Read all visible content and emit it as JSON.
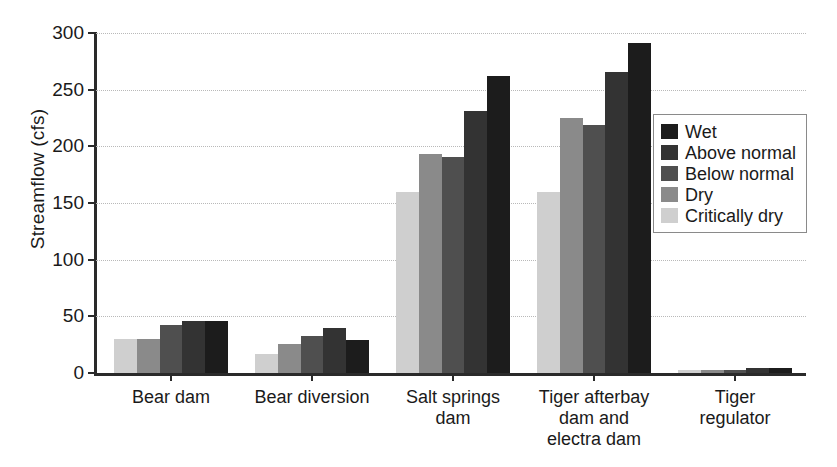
{
  "chart_data": {
    "type": "bar",
    "title": "",
    "xlabel": "",
    "ylabel": "Streamflow (cfs)",
    "ylim": [
      0,
      300
    ],
    "yticks": [
      0,
      50,
      100,
      150,
      200,
      250,
      300
    ],
    "grid": true,
    "legend_position": "right",
    "categories": [
      "Bear dam",
      "Bear diversion",
      "Salt springs dam",
      "Tiger afterbay dam and electra dam",
      "Tiger regulator"
    ],
    "category_lines": [
      [
        "Bear dam"
      ],
      [
        "Bear diversion"
      ],
      [
        "Salt springs",
        "dam"
      ],
      [
        "Tiger afterbay",
        "dam and",
        "electra dam"
      ],
      [
        "Tiger regulator"
      ]
    ],
    "series_draw_order": [
      "Critically dry",
      "Dry",
      "Below normal",
      "Above normal",
      "Wet"
    ],
    "series": [
      {
        "name": "Wet",
        "color": "#1c1c1c",
        "values": [
          46,
          29,
          262,
          291,
          4
        ]
      },
      {
        "name": "Above normal",
        "color": "#333333",
        "values": [
          46,
          40,
          231,
          266,
          4
        ]
      },
      {
        "name": "Below normal",
        "color": "#4f4f4f",
        "values": [
          42,
          33,
          191,
          219,
          3
        ]
      },
      {
        "name": "Dry",
        "color": "#8a8a8a",
        "values": [
          30,
          26,
          193,
          225,
          3
        ]
      },
      {
        "name": "Critically dry",
        "color": "#cfcfcf",
        "values": [
          30,
          17,
          160,
          160,
          3
        ]
      }
    ],
    "legend_entries": [
      {
        "label": "Wet",
        "color": "#1c1c1c"
      },
      {
        "label": "Above normal",
        "color": "#333333"
      },
      {
        "label": "Below normal",
        "color": "#4f4f4f"
      },
      {
        "label": "Dry",
        "color": "#8a8a8a"
      },
      {
        "label": "Critically dry",
        "color": "#cfcfcf"
      }
    ]
  },
  "style": {
    "axis_color": "#2a2a2a",
    "grid_color": "#b9b9b9",
    "text_color": "#1a1a1a",
    "background": "#ffffff"
  }
}
